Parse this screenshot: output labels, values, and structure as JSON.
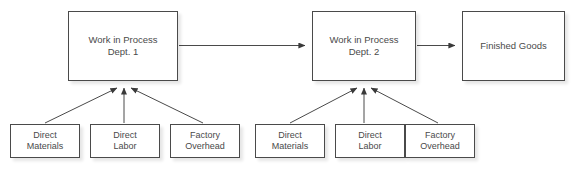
{
  "diagram": {
    "background_color": "#ffffff",
    "box_border_color": "#4a4a4a",
    "text_color": "#4a4a4a",
    "connector_color": "#4a4a4a",
    "nodes": [
      {
        "id": "wip1",
        "label": "Work in Process\nDept. 1",
        "type": "process",
        "x": 68,
        "y": 11,
        "width": 110,
        "height": 70
      },
      {
        "id": "wip2",
        "label": "Work in Process\nDept. 2",
        "type": "process",
        "x": 312,
        "y": 11,
        "width": 104,
        "height": 70
      },
      {
        "id": "fg",
        "label": "Finished Goods",
        "type": "output",
        "x": 462,
        "y": 11,
        "width": 103,
        "height": 70
      },
      {
        "id": "dm1",
        "label": "Direct\nMaterials",
        "type": "input",
        "x": 10,
        "y": 124,
        "width": 70,
        "height": 34
      },
      {
        "id": "dl1",
        "label": "Direct\nLabor",
        "type": "input",
        "x": 90,
        "y": 124,
        "width": 70,
        "height": 34
      },
      {
        "id": "fo1",
        "label": "Factory\nOverhead",
        "type": "input",
        "x": 170,
        "y": 124,
        "width": 70,
        "height": 34
      },
      {
        "id": "dm2",
        "label": "Direct\nMaterials",
        "type": "input",
        "x": 255,
        "y": 124,
        "width": 70,
        "height": 34
      },
      {
        "id": "dl2",
        "label": "Direct\nLabor",
        "type": "input",
        "x": 335,
        "y": 124,
        "width": 70,
        "height": 34
      },
      {
        "id": "fo2",
        "label": "Factory\nOverhead",
        "type": "input",
        "x": 405,
        "y": 124,
        "width": 70,
        "height": 34
      }
    ],
    "edges": [
      {
        "id": "e-wip1-wip2",
        "from": "wip1",
        "to": "wip2",
        "style": "horizontal-arrow"
      },
      {
        "id": "e-wip2-fg",
        "from": "wip2",
        "to": "fg",
        "style": "horizontal-arrow"
      },
      {
        "id": "e-dm1-wip1",
        "from": "dm1",
        "to": "wip1",
        "style": "diagonal-arrow"
      },
      {
        "id": "e-dl1-wip1",
        "from": "dl1",
        "to": "wip1",
        "style": "vertical-arrow"
      },
      {
        "id": "e-fo1-wip1",
        "from": "fo1",
        "to": "wip1",
        "style": "diagonal-arrow"
      },
      {
        "id": "e-dm2-wip2",
        "from": "dm2",
        "to": "wip2",
        "style": "diagonal-arrow"
      },
      {
        "id": "e-dl2-wip2",
        "from": "dl2",
        "to": "wip2",
        "style": "vertical-arrow"
      },
      {
        "id": "e-fo2-wip2",
        "from": "fo2",
        "to": "wip2",
        "style": "diagonal-arrow"
      }
    ]
  }
}
